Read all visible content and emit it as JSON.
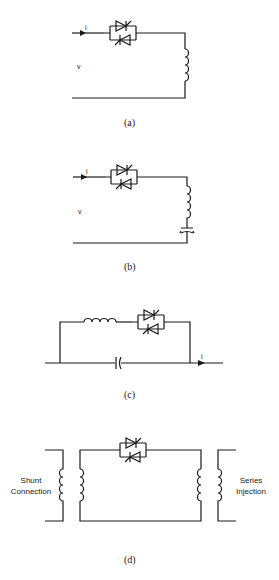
{
  "figure": {
    "panels": [
      {
        "id": "a",
        "caption": "(a)",
        "current_label": "i",
        "voltage_label": "v",
        "components": [
          "bidirectional-thyristor-pair",
          "inductor"
        ]
      },
      {
        "id": "b",
        "caption": "(b)",
        "current_label": "i",
        "voltage_label": "v",
        "components": [
          "bidirectional-thyristor-pair",
          "inductor",
          "capacitor"
        ]
      },
      {
        "id": "c",
        "caption": "(c)",
        "current_label": "i",
        "components": [
          "inductor",
          "bidirectional-thyristor-pair",
          "capacitor"
        ]
      },
      {
        "id": "d",
        "caption": "(d)",
        "left_label_line1": "Shunt",
        "left_label_line2": "Connection",
        "right_label_line1": "Series",
        "right_label_line2": "Injection",
        "components": [
          "transformer",
          "bidirectional-thyristor-pair",
          "transformer"
        ]
      }
    ]
  }
}
